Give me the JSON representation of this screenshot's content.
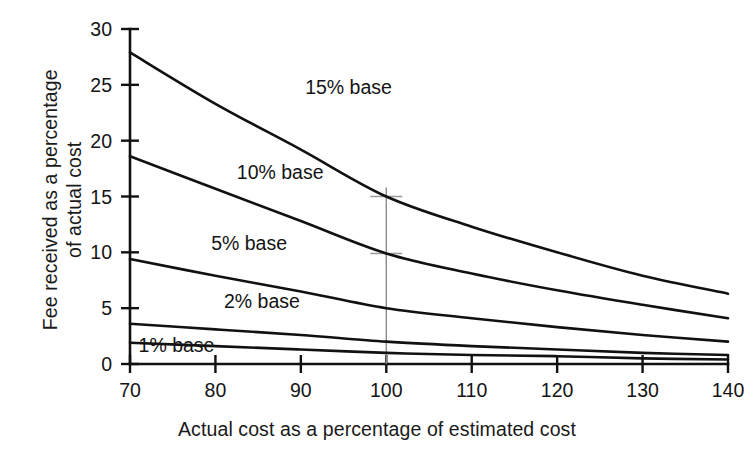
{
  "chart_data": {
    "type": "line",
    "title": "",
    "xlabel": "Actual cost as a percentage of estimated cost",
    "ylabel_line1": "Fee received as a percentage",
    "ylabel_line2": "of actual cost",
    "xlim": [
      70,
      140
    ],
    "ylim": [
      0,
      30
    ],
    "xticks": [
      70,
      80,
      90,
      100,
      110,
      120,
      130,
      140
    ],
    "yticks": [
      0,
      5,
      10,
      15,
      20,
      25,
      30
    ],
    "xtick_labels": [
      "70",
      "80",
      "90",
      "100",
      "110",
      "120",
      "130",
      "140"
    ],
    "ytick_labels": [
      "0",
      "5",
      "10",
      "15",
      "20",
      "25",
      "30"
    ],
    "grid": false,
    "legend_position": "inline-annotations",
    "x": [
      70,
      80,
      90,
      100,
      110,
      120,
      130,
      140
    ],
    "series": [
      {
        "name": "15% base",
        "label": "15% base",
        "values": [
          27.9,
          23.3,
          19.2,
          15.0,
          12.3,
          10.0,
          7.9,
          6.3
        ]
      },
      {
        "name": "10% base",
        "label": "10% base",
        "values": [
          18.6,
          15.7,
          12.8,
          9.9,
          8.1,
          6.6,
          5.3,
          4.1
        ]
      },
      {
        "name": "5% base",
        "label": "5% base",
        "values": [
          9.4,
          7.9,
          6.5,
          5.0,
          4.1,
          3.3,
          2.6,
          2.0
        ]
      },
      {
        "name": "2% base",
        "label": "2% base",
        "values": [
          3.6,
          3.1,
          2.6,
          2.0,
          1.6,
          1.3,
          1.0,
          0.8
        ]
      },
      {
        "name": "1% base",
        "label": "1% base",
        "values": [
          1.9,
          1.6,
          1.3,
          1.0,
          0.8,
          0.7,
          0.5,
          0.4
        ]
      }
    ],
    "annotations": [
      {
        "text": "15% base",
        "x": 90.5,
        "y": 24.2
      },
      {
        "text": "10% base",
        "x": 82.5,
        "y": 16.6
      },
      {
        "text": "5% base",
        "x": 79.5,
        "y": 10.2
      },
      {
        "text": "2% base",
        "x": 81.0,
        "y": 5.0
      },
      {
        "text": "1% base",
        "x": 71.0,
        "y": 1.1
      }
    ],
    "reference_marker": {
      "x": 100,
      "y_top": 15.0,
      "y_bottom": 0,
      "color": "#8c8c8c",
      "crossings": [
        15.0,
        9.9
      ]
    },
    "line_color": "#111111"
  }
}
